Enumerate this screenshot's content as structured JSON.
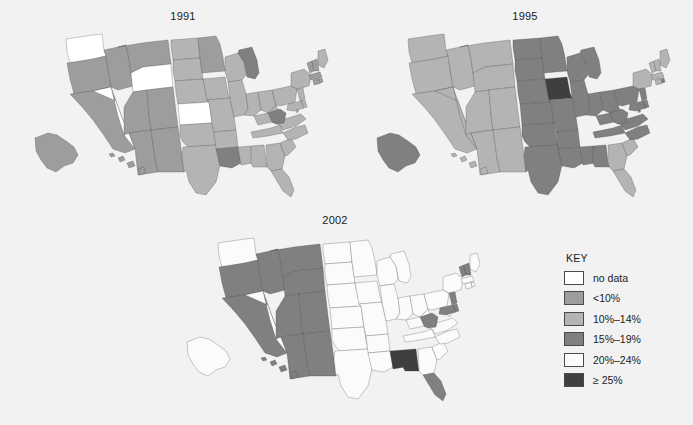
{
  "figure": {
    "background": "#f2f2f2",
    "maps": [
      {
        "id": "map-1991",
        "title": "1991"
      },
      {
        "id": "map-1995",
        "title": "1995"
      },
      {
        "id": "map-2002",
        "title": "2002"
      }
    ]
  },
  "legend": {
    "title": "KEY",
    "items": [
      {
        "label": "no data",
        "color": "#ffffff"
      },
      {
        "label": "<10%",
        "color": "#9d9d9d"
      },
      {
        "label": "10%–14%",
        "color": "#b4b4b4"
      },
      {
        "label": "15%–19%",
        "color": "#808080"
      },
      {
        "label": "20%–24%",
        "color": "#fbfbfb"
      },
      {
        "label": "≥ 25%",
        "color": "#3f3f3f"
      }
    ]
  },
  "chart_data": {
    "type": "choropleth",
    "panels": [
      "1991",
      "1995",
      "2002"
    ],
    "classes": [
      "no data",
      "<10%",
      "10%–14%",
      "15%–19%",
      "20%–24%",
      "≥ 25%"
    ],
    "class_colors": [
      "#ffffff",
      "#9d9d9d",
      "#b4b4b4",
      "#808080",
      "#fbfbfb",
      "#3f3f3f"
    ],
    "legend_position": "right",
    "values": {
      "1991": {
        "AL": "10%–14%",
        "AK": "<10%",
        "AZ": "<10%",
        "AR": "10%–14%",
        "CA": "<10%",
        "CO": "<10%",
        "CT": "<10%",
        "DE": "10%–14%",
        "FL": "10%–14%",
        "GA": "10%–14%",
        "HI": "<10%",
        "ID": "<10%",
        "IL": "10%–14%",
        "IN": "10%–14%",
        "IA": "10%–14%",
        "KS": "no data",
        "KY": "10%–14%",
        "LA": "15%–19%",
        "ME": "10%–14%",
        "MD": "10%–14%",
        "MA": "<10%",
        "MI": "15%–19%",
        "MN": "<10%",
        "MS": "10%–14%",
        "MO": "10%–14%",
        "MT": "<10%",
        "NE": "10%–14%",
        "NV": "no data",
        "NH": "<10%",
        "NJ": "10%–14%",
        "NM": "<10%",
        "NY": "10%–14%",
        "NC": "10%–14%",
        "ND": "10%–14%",
        "OH": "10%–14%",
        "OK": "10%–14%",
        "OR": "<10%",
        "PA": "10%–14%",
        "RI": "<10%",
        "SC": "10%–14%",
        "SD": "10%–14%",
        "TN": "10%–14%",
        "TX": "10%–14%",
        "UT": "<10%",
        "VT": "<10%",
        "VA": "10%–14%",
        "WA": "no data",
        "WV": "15%–19%",
        "WI": "10%–14%",
        "WY": "no data",
        "DC": "10%–14%"
      },
      "1995": {
        "AL": "15%–19%",
        "AK": "15%–19%",
        "AZ": "10%–14%",
        "AR": "15%–19%",
        "CA": "10%–14%",
        "CO": "10%–14%",
        "CT": "10%–14%",
        "DE": "15%–19%",
        "FL": "10%–14%",
        "GA": "10%–14%",
        "HI": "10%–14%",
        "ID": "10%–14%",
        "IL": "15%–19%",
        "IN": "15%–19%",
        "IA": "≥ 25%",
        "KS": "15%–19%",
        "KY": "15%–19%",
        "LA": "15%–19%",
        "ME": "10%–14%",
        "MD": "15%–19%",
        "MA": "10%–14%",
        "MI": "15%–19%",
        "MN": "15%–19%",
        "MS": "15%–19%",
        "MO": "15%–19%",
        "MT": "10%–14%",
        "NE": "15%–19%",
        "NV": "10%–14%",
        "NH": "10%–14%",
        "NJ": "15%–19%",
        "NM": "10%–14%",
        "NY": "10%–14%",
        "NC": "15%–19%",
        "ND": "15%–19%",
        "OH": "15%–19%",
        "OK": "15%–19%",
        "OR": "10%–14%",
        "PA": "15%–19%",
        "RI": "15%–19%",
        "SC": "10%–14%",
        "SD": "15%–19%",
        "TN": "15%–19%",
        "TX": "15%–19%",
        "UT": "10%–14%",
        "VT": "10%–14%",
        "VA": "15%–19%",
        "WA": "10%–14%",
        "WV": "15%–19%",
        "WI": "15%–19%",
        "WY": "10%–14%",
        "DC": "15%–19%"
      },
      "2002": {
        "AL": "≥ 25%",
        "AK": "20%–24%",
        "AZ": "15%–19%",
        "AR": "20%–24%",
        "CA": "15%–19%",
        "CO": "15%–19%",
        "CT": "20%–24%",
        "DE": "15%–19%",
        "FL": "15%–19%",
        "GA": "20%–24%",
        "HI": "15%–19%",
        "ID": "15%–19%",
        "IL": "20%–24%",
        "IN": "20%–24%",
        "IA": "20%–24%",
        "KS": "20%–24%",
        "KY": "20%–24%",
        "LA": "20%–24%",
        "ME": "20%–24%",
        "MD": "15%–19%",
        "MA": "20%–24%",
        "MI": "20%–24%",
        "MN": "20%–24%",
        "MS": "≥ 25%",
        "MO": "20%–24%",
        "MT": "15%–19%",
        "NE": "20%–24%",
        "NV": "20%–24%",
        "NH": "15%–19%",
        "NJ": "15%–19%",
        "NM": "15%–19%",
        "NY": "20%–24%",
        "NC": "20%–24%",
        "ND": "20%–24%",
        "OH": "20%–24%",
        "OK": "20%–24%",
        "OR": "15%–19%",
        "PA": "20%–24%",
        "RI": "20%–24%",
        "SC": "20%–24%",
        "SD": "20%–24%",
        "TN": "20%–24%",
        "TX": "20%–24%",
        "UT": "15%–19%",
        "VT": "15%–19%",
        "VA": "20%–24%",
        "WA": "20%–24%",
        "WV": "15%–19%",
        "WI": "20%–24%",
        "WY": "15%–19%",
        "DC": "20%–24%"
      }
    }
  }
}
